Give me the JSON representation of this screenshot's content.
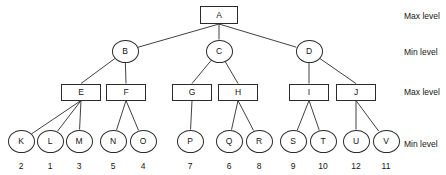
{
  "diagram": {
    "stroke_color": "#2b2b2b",
    "text_color": "#151515",
    "background": "#ffffff",
    "level_labels": [
      {
        "text": "Max level",
        "y": 12
      },
      {
        "text": "Min level",
        "y": 48
      },
      {
        "text": "Max level",
        "y": 88
      },
      {
        "text": "Min level",
        "y": 140
      }
    ],
    "nodes": [
      {
        "id": "A",
        "label": "A",
        "shape": "box",
        "cx": 219,
        "cy": 15,
        "w": 38,
        "h": 18
      },
      {
        "id": "B",
        "label": "B",
        "shape": "circle",
        "cx": 125,
        "cy": 51,
        "w": 27,
        "h": 23
      },
      {
        "id": "C",
        "label": "C",
        "shape": "circle",
        "cx": 219,
        "cy": 51,
        "w": 27,
        "h": 23
      },
      {
        "id": "D",
        "label": "D",
        "shape": "circle",
        "cx": 309,
        "cy": 51,
        "w": 27,
        "h": 23
      },
      {
        "id": "E",
        "label": "E",
        "shape": "box",
        "cx": 81,
        "cy": 92,
        "w": 40,
        "h": 17
      },
      {
        "id": "F",
        "label": "F",
        "shape": "box",
        "cx": 126,
        "cy": 92,
        "w": 40,
        "h": 17
      },
      {
        "id": "G",
        "label": "G",
        "shape": "box",
        "cx": 192,
        "cy": 92,
        "w": 40,
        "h": 17
      },
      {
        "id": "H",
        "label": "H",
        "shape": "box",
        "cx": 238,
        "cy": 92,
        "w": 40,
        "h": 17
      },
      {
        "id": "I",
        "label": "I",
        "shape": "box",
        "cx": 309,
        "cy": 92,
        "w": 40,
        "h": 17
      },
      {
        "id": "J",
        "label": "J",
        "shape": "box",
        "cx": 356,
        "cy": 92,
        "w": 40,
        "h": 17
      },
      {
        "id": "K",
        "label": "K",
        "shape": "circle",
        "cx": 21,
        "cy": 141,
        "w": 27,
        "h": 23,
        "value": "2"
      },
      {
        "id": "L",
        "label": "L",
        "shape": "circle",
        "cx": 50,
        "cy": 141,
        "w": 27,
        "h": 23,
        "value": "1"
      },
      {
        "id": "M",
        "label": "M",
        "shape": "circle",
        "cx": 79,
        "cy": 141,
        "w": 27,
        "h": 23,
        "value": "3"
      },
      {
        "id": "N",
        "label": "N",
        "shape": "circle",
        "cx": 113,
        "cy": 141,
        "w": 27,
        "h": 23,
        "value": "5"
      },
      {
        "id": "O",
        "label": "O",
        "shape": "circle",
        "cx": 143,
        "cy": 141,
        "w": 27,
        "h": 23,
        "value": "4"
      },
      {
        "id": "P",
        "label": "P",
        "shape": "circle",
        "cx": 190,
        "cy": 141,
        "w": 27,
        "h": 23,
        "value": "7"
      },
      {
        "id": "Q",
        "label": "Q",
        "shape": "circle",
        "cx": 229,
        "cy": 141,
        "w": 27,
        "h": 23,
        "value": "6"
      },
      {
        "id": "R",
        "label": "R",
        "shape": "circle",
        "cx": 259,
        "cy": 141,
        "w": 27,
        "h": 23,
        "value": "8"
      },
      {
        "id": "S",
        "label": "S",
        "shape": "circle",
        "cx": 293,
        "cy": 141,
        "w": 27,
        "h": 23,
        "value": "9"
      },
      {
        "id": "T",
        "label": "T",
        "shape": "circle",
        "cx": 323,
        "cy": 141,
        "w": 27,
        "h": 23,
        "value": "10"
      },
      {
        "id": "U",
        "label": "U",
        "shape": "circle",
        "cx": 356,
        "cy": 141,
        "w": 27,
        "h": 23,
        "value": "12"
      },
      {
        "id": "V",
        "label": "V",
        "shape": "circle",
        "cx": 386,
        "cy": 141,
        "w": 27,
        "h": 23,
        "value": "11"
      }
    ],
    "edges": [
      {
        "from": "A",
        "to": "B"
      },
      {
        "from": "A",
        "to": "C"
      },
      {
        "from": "A",
        "to": "D"
      },
      {
        "from": "B",
        "to": "E"
      },
      {
        "from": "B",
        "to": "F"
      },
      {
        "from": "C",
        "to": "G"
      },
      {
        "from": "C",
        "to": "H"
      },
      {
        "from": "D",
        "to": "I"
      },
      {
        "from": "D",
        "to": "J"
      },
      {
        "from": "E",
        "to": "K"
      },
      {
        "from": "E",
        "to": "L"
      },
      {
        "from": "E",
        "to": "M"
      },
      {
        "from": "F",
        "to": "N"
      },
      {
        "from": "F",
        "to": "O"
      },
      {
        "from": "G",
        "to": "P"
      },
      {
        "from": "H",
        "to": "Q"
      },
      {
        "from": "H",
        "to": "R"
      },
      {
        "from": "I",
        "to": "S"
      },
      {
        "from": "I",
        "to": "T"
      },
      {
        "from": "J",
        "to": "U"
      },
      {
        "from": "J",
        "to": "V"
      }
    ],
    "leaf_value_y": 162,
    "label_x": 404
  }
}
